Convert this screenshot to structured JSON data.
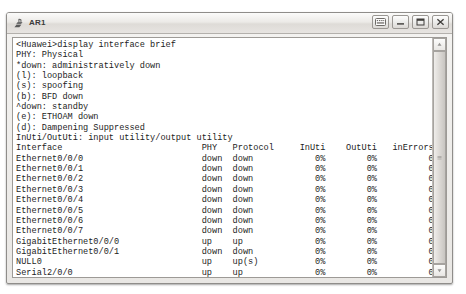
{
  "window": {
    "title": "AR1",
    "icon": "router-icon",
    "buttons": [
      {
        "name": "keyboard-button",
        "icon": "keyboard-icon"
      },
      {
        "name": "minimize-button",
        "icon": "minimize-icon"
      },
      {
        "name": "maximize-button",
        "icon": "maximize-icon"
      },
      {
        "name": "close-button",
        "icon": "close-icon"
      }
    ]
  },
  "terminal": {
    "prompt_command": "<Huawei>display interface brief",
    "legend": [
      "PHY: Physical",
      "*down: administratively down",
      "(l): loopback",
      "(s): spoofing",
      "(b): BFD down",
      "^down: standby",
      "(e): ETHOAM down",
      "(d): Dampening Suppressed",
      "InUti/OutUti: input utility/output utility"
    ],
    "table": {
      "headers": [
        "Interface",
        "PHY",
        "Protocol",
        "InUti",
        "OutUti",
        "inErrors",
        "outErrors"
      ],
      "rows": [
        [
          "Ethernet0/0/0",
          "down",
          "down",
          "0%",
          "0%",
          "0",
          "0"
        ],
        [
          "Ethernet0/0/1",
          "down",
          "down",
          "0%",
          "0%",
          "0",
          "0"
        ],
        [
          "Ethernet0/0/2",
          "down",
          "down",
          "0%",
          "0%",
          "0",
          "0"
        ],
        [
          "Ethernet0/0/3",
          "down",
          "down",
          "0%",
          "0%",
          "0",
          "0"
        ],
        [
          "Ethernet0/0/4",
          "down",
          "down",
          "0%",
          "0%",
          "0",
          "0"
        ],
        [
          "Ethernet0/0/5",
          "down",
          "down",
          "0%",
          "0%",
          "0",
          "0"
        ],
        [
          "Ethernet0/0/6",
          "down",
          "down",
          "0%",
          "0%",
          "0",
          "0"
        ],
        [
          "Ethernet0/0/7",
          "down",
          "down",
          "0%",
          "0%",
          "0",
          "0"
        ],
        [
          "GigabitEthernet0/0/0",
          "up",
          "up",
          "0%",
          "0%",
          "0",
          "0"
        ],
        [
          "GigabitEthernet0/0/1",
          "down",
          "down",
          "0%",
          "0%",
          "0",
          "0"
        ],
        [
          "NULL0",
          "up",
          "up(s)",
          "0%",
          "0%",
          "0",
          "0"
        ],
        [
          "Serial2/0/0",
          "up",
          "up",
          "0%",
          "0%",
          "0",
          "0"
        ],
        [
          "Serial2/0/1",
          "down",
          "down",
          "0%",
          "0%",
          "0",
          "0"
        ]
      ]
    },
    "trailing_prompt": "<Huawei>"
  },
  "scrollbar": {
    "up_arrow": "scroll-up-icon",
    "down_arrow": "scroll-down-icon",
    "thumb_top_pct": 0,
    "thumb_height_pct": 100
  },
  "colors": {
    "text": "#1d1d1d",
    "terminal_bg": "#ffffff",
    "chrome": "#e9e7e4"
  }
}
